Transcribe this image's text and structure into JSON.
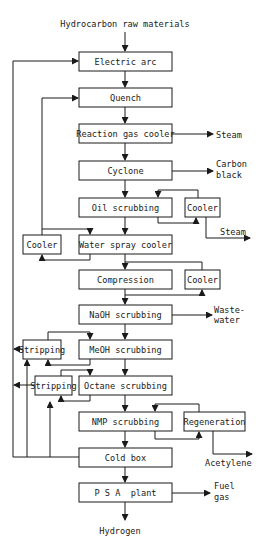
{
  "input_label": "Hydrocarbon raw materials",
  "output_label": "Hydrogen",
  "main_steps": [
    {
      "id": "electric-arc",
      "label": "Electric arc",
      "y": 52
    },
    {
      "id": "quench",
      "label": "Quench",
      "y": 88
    },
    {
      "id": "reaction-gas-cooler",
      "label": "Reaction gas cooler",
      "y": 124
    },
    {
      "id": "cyclone",
      "label": "Cyclone",
      "y": 161
    },
    {
      "id": "oil-scrubbing",
      "label": "Oil scrubbing",
      "y": 198
    },
    {
      "id": "water-spray-cooler",
      "label": "Water spray cooler",
      "y": 235
    },
    {
      "id": "compression",
      "label": "Compression",
      "y": 270
    },
    {
      "id": "naoh-scrubbing",
      "label": "NaOH scrubbing",
      "y": 305
    },
    {
      "id": "meoh-scrubbing",
      "label": "MeOH scrubbing",
      "y": 340
    },
    {
      "id": "octane-scrubbing",
      "label": "Octane scrubbing",
      "y": 376
    },
    {
      "id": "nmp-scrubbing",
      "label": "NMP scrubbing",
      "y": 412
    },
    {
      "id": "cold-box",
      "label": "Cold box",
      "y": 448
    },
    {
      "id": "psa-plant",
      "label": "P S A  plant",
      "y": 483
    }
  ],
  "side_units": {
    "cooler_oil": "Cooler",
    "cooler_water": "Cooler",
    "cooler_compression": "Cooler",
    "stripping_meoh": "Stripping",
    "stripping_octane": "Stripping",
    "regeneration": "Regeneration"
  },
  "outputs": {
    "steam_1": "Steam",
    "carbon_black_1": "Carbon",
    "carbon_black_2": "black",
    "steam_2": "Steam",
    "wastewater_1": "Waste-",
    "wastewater_2": "water",
    "acetylene": "Acetylene",
    "fuel_gas_1": "Fuel",
    "fuel_gas_2": "gas"
  },
  "colors": {
    "stroke": "#1a1a1a",
    "background": "#ffffff"
  }
}
